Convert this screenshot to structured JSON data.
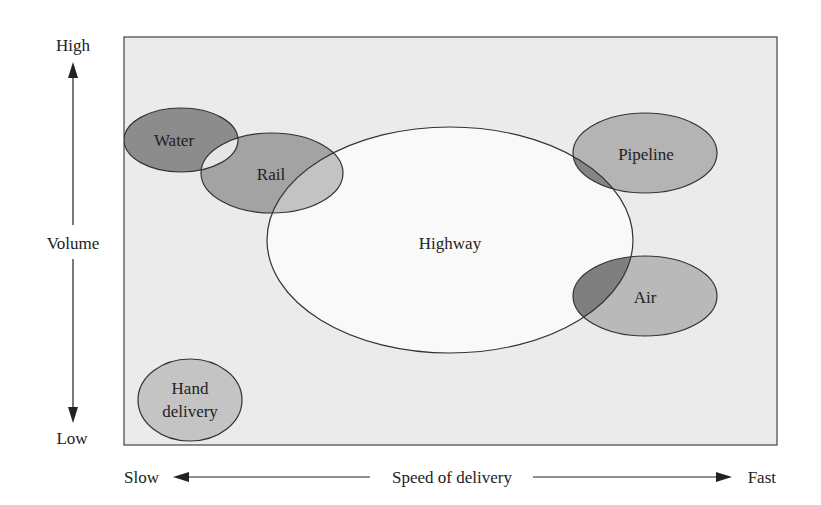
{
  "diagram": {
    "type": "overlapping-ellipses",
    "colors": {
      "page_background": "#ffffff",
      "frame_fill": "#ebebeb",
      "frame_stroke": "#444444",
      "highway_fill": "#f9f9f9",
      "water_fill": "#8c8c8c",
      "rail_fill": "#a3a3a3",
      "pipeline_fill": "#b4b4b4",
      "air_fill": "#b9b9b9",
      "hand_fill": "#c4c4c4",
      "water_rail_overlap": "#e6e6e6",
      "rail_highway_overlap": "#c3c3c3",
      "pipeline_highway_overlap": "#858585",
      "air_highway_overlap": "#7f7f7f",
      "text": "#222222"
    },
    "y_axis": {
      "title": "Volume",
      "high_label": "High",
      "low_label": "Low"
    },
    "x_axis": {
      "title": "Speed of delivery",
      "slow_label": "Slow",
      "fast_label": "Fast"
    },
    "modes": [
      {
        "id": "water",
        "label": "Water"
      },
      {
        "id": "rail",
        "label": "Rail"
      },
      {
        "id": "highway",
        "label": "Highway"
      },
      {
        "id": "pipeline",
        "label": "Pipeline"
      },
      {
        "id": "air",
        "label": "Air"
      },
      {
        "id": "hand",
        "label_line1": "Hand",
        "label_line2": "delivery"
      }
    ]
  }
}
